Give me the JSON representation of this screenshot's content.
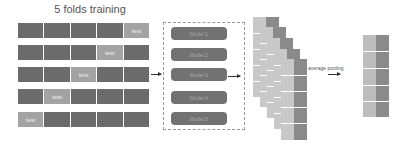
{
  "title": "5 folds training",
  "folds": [
    {
      "cells": [
        "",
        "",
        "",
        "",
        "test"
      ],
      "test_index": 4
    },
    {
      "cells": [
        "",
        "",
        "",
        "test",
        ""
      ],
      "test_index": 3
    },
    {
      "cells": [
        "",
        "",
        "test",
        "",
        ""
      ],
      "test_index": 2
    },
    {
      "cells": [
        "",
        "test",
        "",
        "",
        ""
      ],
      "test_index": 1
    },
    {
      "cells": [
        "test",
        "",
        "",
        "",
        ""
      ],
      "test_index": 0
    }
  ],
  "models": [
    "Model 1",
    "Model 2",
    "Model 3",
    "Model 4",
    "Model 5"
  ],
  "pooling_label": "average pooling",
  "colors": {
    "train": "#6b6b6b",
    "test": "#a3a3a3",
    "model": "#727272",
    "pred_light": "#c8c8c8",
    "pred_dark": "#8a8a8a"
  }
}
